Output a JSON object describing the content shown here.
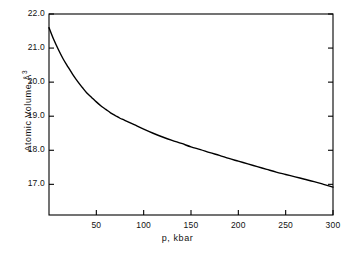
{
  "chart_data": {
    "type": "line",
    "title": "",
    "subtitle": "",
    "xlabel": "p, kbar",
    "ylabel": "Atomic Volume, Å³",
    "ylabel_text": "Atomic Volume,",
    "ylabel_unit": "Å",
    "ylabel_unit_exponent": "3",
    "xlim": [
      0,
      300
    ],
    "ylim": [
      16.1,
      22.0
    ],
    "xticks": [
      50,
      100,
      150,
      200,
      250,
      300
    ],
    "xtick_labels": [
      "50",
      "100",
      "150",
      "200",
      "250",
      "300"
    ],
    "yticks": [
      17.0,
      18.0,
      19.0,
      20.0,
      21.0,
      22.0
    ],
    "ytick_labels": [
      "17.0",
      "18.0",
      "19.0",
      "20.0",
      "21.0",
      "22.0"
    ],
    "grid": false,
    "legend": null,
    "legend_position": "none",
    "annotations": [],
    "line_color": "#000000",
    "frame_color": "#000000",
    "background_color": "#ffffff",
    "series": [
      {
        "name": "atomic volume vs pressure",
        "x": [
          0,
          5,
          10,
          15,
          20,
          25,
          30,
          35,
          40,
          45,
          50,
          55,
          60,
          65,
          70,
          75,
          80,
          90,
          100,
          110,
          120,
          130,
          140,
          150,
          160,
          170,
          180,
          190,
          200,
          210,
          220,
          230,
          240,
          250,
          260,
          270,
          280,
          290,
          300
        ],
        "y": [
          21.6,
          21.25,
          20.95,
          20.68,
          20.45,
          20.23,
          20.03,
          19.85,
          19.68,
          19.55,
          19.42,
          19.3,
          19.2,
          19.1,
          19.02,
          18.94,
          18.88,
          18.75,
          18.62,
          18.5,
          18.39,
          18.29,
          18.2,
          18.1,
          18.02,
          17.93,
          17.85,
          17.76,
          17.68,
          17.6,
          17.52,
          17.44,
          17.36,
          17.29,
          17.22,
          17.15,
          17.08,
          17.0,
          16.92
        ]
      }
    ]
  },
  "axes": {
    "frame": {
      "left_px": 49,
      "top_px": 14,
      "right_px": 333,
      "bottom_px": 215
    }
  }
}
